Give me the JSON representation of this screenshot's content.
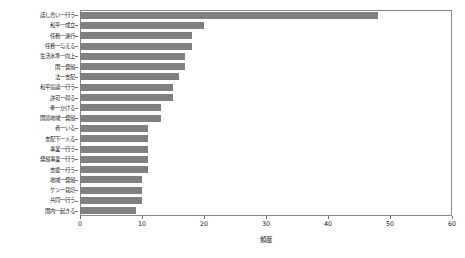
{
  "chart_data": {
    "type": "bar",
    "orientation": "horizontal",
    "title": "",
    "xlabel": "頻度",
    "ylabel": "",
    "xlim": [
      0,
      60
    ],
    "xticks": [
      0,
      10,
      20,
      30,
      40,
      50,
      60
    ],
    "grid": false,
    "legend": null,
    "bar_color": "#808080",
    "frame_color": "#8a8a8a",
    "categories": [
      "話し合い一行う",
      "和平一成立",
      "任務一遂行",
      "任務一与える",
      "生活水準一向上",
      "国一発展",
      "法一支配",
      "和平協議一行う",
      "許可一得る",
      "牽一かける",
      "国境地域一発展",
      "者一いる",
      "支配下一入る",
      "事業一行う",
      "発展事業一行う",
      "支援一行う",
      "地域一発展",
      "ケシ一栽培",
      "共同一行う",
      "国内一起きる"
    ],
    "values": [
      48,
      20,
      18,
      18,
      17,
      17,
      16,
      15,
      15,
      13,
      13,
      11,
      11,
      11,
      11,
      11,
      10,
      10,
      10,
      9
    ]
  }
}
